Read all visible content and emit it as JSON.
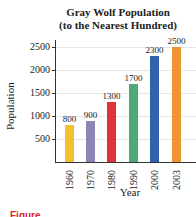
{
  "chart_data": {
    "type": "bar",
    "title": "Gray Wolf Population",
    "subtitle": "(to the Nearest Hundred)",
    "xlabel": "Year",
    "ylabel": "Population",
    "categories": [
      "1960",
      "1970",
      "1980",
      "1990",
      "2000",
      "2003"
    ],
    "values": [
      800,
      900,
      1300,
      1700,
      2300,
      2500
    ],
    "value_labels": [
      "800",
      "900",
      "1300",
      "1700",
      "2300",
      "2500"
    ],
    "colors": [
      "#f2c12e",
      "#8c86b4",
      "#e0323c",
      "#4fa87a",
      "#2f63ae",
      "#ee9433"
    ],
    "yticks": [
      "500",
      "1000",
      "1500",
      "2000",
      "2500"
    ],
    "ylim": [
      0,
      2600
    ],
    "grid": true,
    "legend": "none"
  },
  "caption": {
    "label": "Figure"
  }
}
